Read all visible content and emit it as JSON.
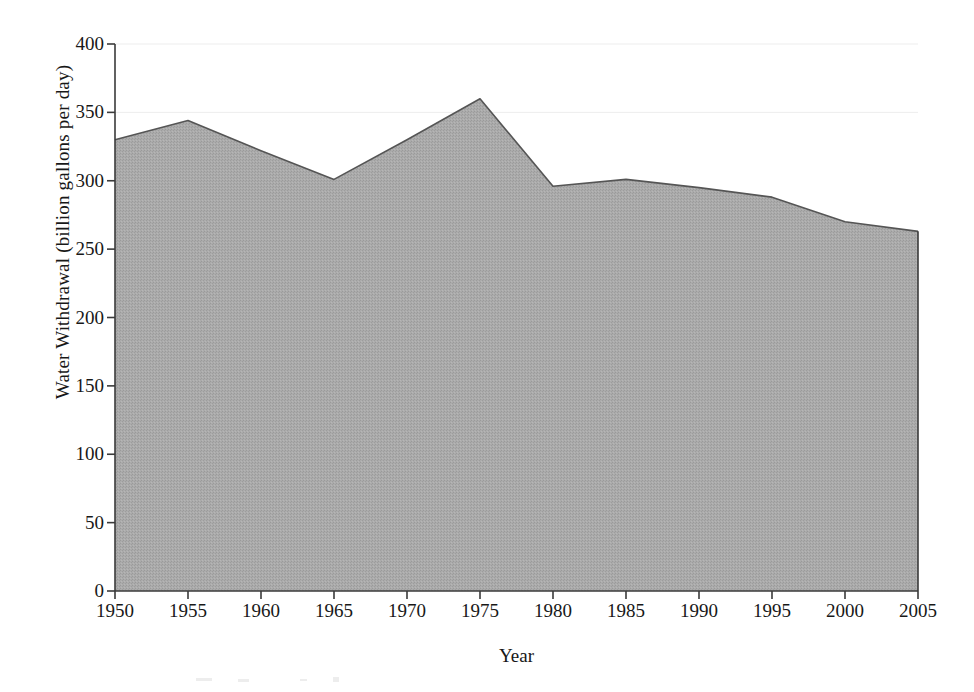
{
  "chart_data": {
    "type": "area",
    "title": "",
    "xlabel": "Year",
    "ylabel": "Water Withdrawal (billion gallons per day)",
    "x": [
      1950,
      1955,
      1960,
      1965,
      1970,
      1975,
      1980,
      1985,
      1990,
      1995,
      2000,
      2005
    ],
    "values": [
      330,
      344,
      322,
      301,
      330,
      360,
      296,
      301,
      295,
      288,
      270,
      263
    ],
    "series": [
      {
        "name": "Water Withdrawal",
        "values": [
          330,
          344,
          322,
          301,
          330,
          360,
          296,
          301,
          295,
          288,
          270,
          263
        ]
      }
    ],
    "xlim": [
      1950,
      2005
    ],
    "ylim": [
      0,
      400
    ],
    "ytick_values": [
      0,
      50,
      100,
      150,
      200,
      250,
      300,
      350,
      400
    ],
    "ytick_labels": [
      "0",
      "50",
      "100",
      "150",
      "200",
      "250",
      "300",
      "350",
      "400"
    ],
    "xtick_labels": [
      "1950",
      "1955",
      "1960",
      "1965",
      "1970",
      "1975",
      "1980",
      "1985",
      "1990",
      "1995",
      "2000",
      "2005"
    ],
    "grid": "faint horizontal gridlines at 350 and 400",
    "legend": "none",
    "fill_color": "#a8a8a8",
    "line_color": "#555555",
    "axis_color": "#3a3a3a",
    "background_color": "#ffffff",
    "gridline_color": "#ededed"
  }
}
